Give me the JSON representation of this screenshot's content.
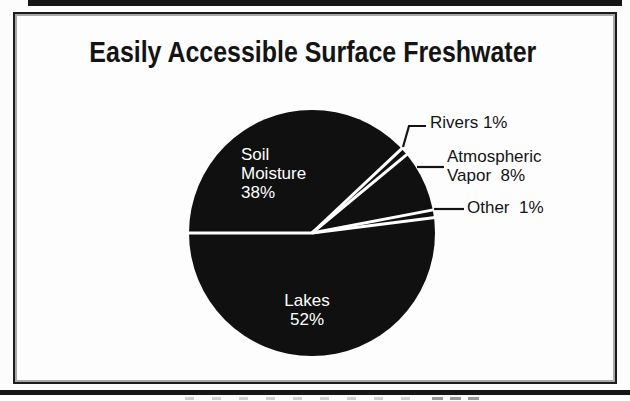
{
  "title": "Easily Accessible Surface Freshwater",
  "chart_data": {
    "type": "pie",
    "title": "Easily Accessible Surface Freshwater",
    "units": "percent",
    "start_angle_deg": 180,
    "direction": "clockwise",
    "legend": false,
    "slices": [
      {
        "label": "Soil Moisture",
        "value": 38,
        "label_position": "inside"
      },
      {
        "label": "Rivers",
        "value": 1,
        "label_position": "outside"
      },
      {
        "label": "Atmospheric Vapor",
        "value": 8,
        "label_position": "outside"
      },
      {
        "label": "Other",
        "value": 1,
        "label_position": "outside"
      },
      {
        "label": "Lakes",
        "value": 52,
        "label_position": "inside"
      }
    ],
    "colors": {
      "slice_fill": "#101010",
      "separator": "#ffffff",
      "inside_label_text": "#ffffff",
      "outside_label_text": "#141414"
    }
  },
  "labels": {
    "soil": "Soil\nMoisture\n38%",
    "lakes": "Lakes\n52%",
    "rivers": "Rivers 1%",
    "atmospheric": "Atmospheric\nVapor  8%",
    "other": "Other  1%"
  },
  "colors": {
    "page_bg": "#fcfcfc",
    "frame_border": "#1c1c1c",
    "frame_inner_line": "#a8a8a8",
    "scan_edge": "#161616",
    "title_text": "#141414",
    "leader_line": "#141414"
  }
}
